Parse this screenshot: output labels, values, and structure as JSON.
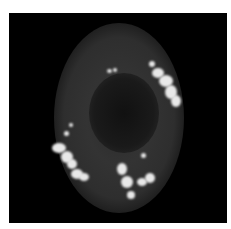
{
  "image": {
    "description": "Fluorescence microscopy image of a single cell on black background with bright punctate spots",
    "background_color": "#000000",
    "cell_color": "#3a3a3a",
    "puncta_color": "#e8e8e8"
  }
}
